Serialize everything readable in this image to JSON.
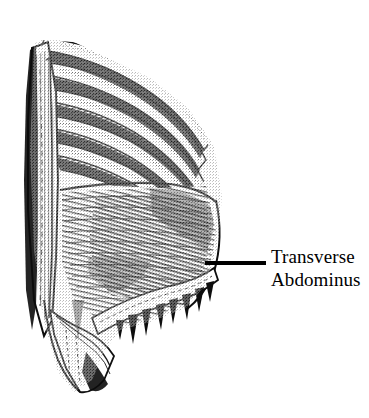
{
  "figure": {
    "kind": "anatomical-illustration",
    "subject": "Transverse Abdominus",
    "background_color": "#ffffff",
    "ink_color": "#000000",
    "width": 369,
    "height": 418
  },
  "annotation": {
    "label_line_1": "Transverse",
    "label_line_2": "Abdominus",
    "leader_line": {
      "x_start": 205,
      "x_end": 266,
      "y": 263,
      "thickness": 4,
      "color": "#000000"
    },
    "text_color": "#000000",
    "text_left": 271,
    "text_top": 245,
    "font_size_px": 19
  },
  "structures": [
    {
      "name": "rib-1",
      "region": "thorax"
    },
    {
      "name": "rib-2",
      "region": "thorax"
    },
    {
      "name": "rib-3",
      "region": "thorax"
    },
    {
      "name": "rib-4",
      "region": "thorax"
    },
    {
      "name": "rib-5",
      "region": "thorax"
    },
    {
      "name": "rib-6",
      "region": "thorax"
    },
    {
      "name": "intercostal-muscles",
      "region": "thorax"
    },
    {
      "name": "sternum-border",
      "region": "midline"
    },
    {
      "name": "transversus-abdominis",
      "region": "abdomen"
    },
    {
      "name": "aponeurosis-band",
      "region": "abdomen"
    },
    {
      "name": "inguinal-region",
      "region": "pelvis"
    }
  ]
}
